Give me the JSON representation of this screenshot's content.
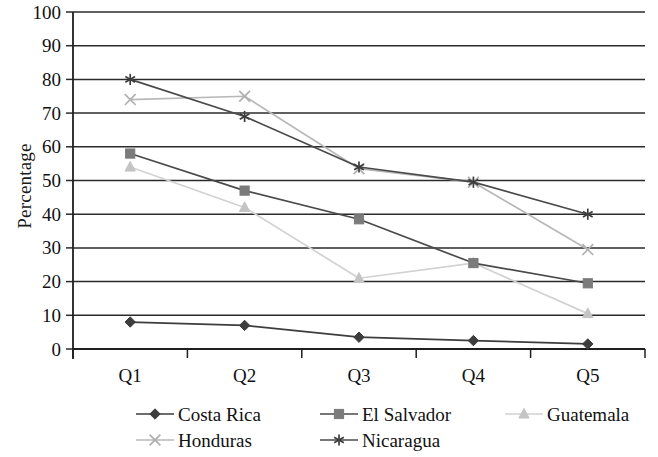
{
  "chart_data": {
    "type": "line",
    "title": "",
    "xlabel": "",
    "ylabel": "Percentage",
    "categories": [
      "Q1",
      "Q2",
      "Q3",
      "Q4",
      "Q5"
    ],
    "ylim": [
      0,
      100
    ],
    "yticks": [
      0,
      10,
      20,
      30,
      40,
      50,
      60,
      70,
      80,
      90,
      100
    ],
    "ytick_labels": [
      "0",
      "10",
      "20",
      "30",
      "40",
      "50",
      "60",
      "70",
      "80",
      "90",
      "100"
    ],
    "grid": true,
    "grid_axis": "y",
    "legend_position": "bottom",
    "series": [
      {
        "name": "Costa Rica",
        "values": [
          8,
          7,
          3.5,
          2.5,
          1.5
        ],
        "color": "#3d3d3d",
        "marker": "diamond",
        "marker_color": "#3d3d3d"
      },
      {
        "name": "El Salvador",
        "values": [
          58,
          47,
          38.5,
          25.5,
          19.5
        ],
        "color": "#4a4a4a",
        "marker": "square",
        "marker_color": "#7b7b7b"
      },
      {
        "name": "Guatemala",
        "values": [
          54,
          42,
          21,
          25.5,
          10.5
        ],
        "color": "#d2d2d2",
        "marker": "triangle",
        "marker_color": "#c4c4c4"
      },
      {
        "name": "Honduras",
        "values": [
          74,
          75,
          53.5,
          49.5,
          29.5
        ],
        "color": "#b8b8b8",
        "marker": "cross",
        "marker_color": "#b0b0b0"
      },
      {
        "name": "Nicaragua",
        "values": [
          80,
          69,
          54,
          49.5,
          40
        ],
        "color": "#4a4a4a",
        "marker": "asterisk",
        "marker_color": "#3d3d3d"
      }
    ]
  },
  "axes": {
    "y_title": "Percentage"
  }
}
